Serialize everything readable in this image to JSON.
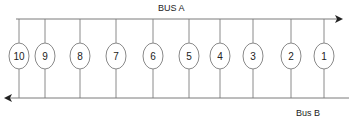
{
  "diagram": {
    "bus_a": {
      "label": "BUS A",
      "direction": "right",
      "y": 19,
      "x_start": 16,
      "x_end": 343
    },
    "bus_b": {
      "label": "Bus B",
      "direction": "left",
      "y": 98,
      "x_start": 4,
      "x_end": 349
    },
    "nodes": [
      {
        "id": "10",
        "label": "10",
        "x": 19
      },
      {
        "id": "9",
        "label": "9",
        "x": 45
      },
      {
        "id": "8",
        "label": "8",
        "x": 80
      },
      {
        "id": "7",
        "label": "7",
        "x": 116
      },
      {
        "id": "6",
        "label": "6",
        "x": 153
      },
      {
        "id": "5",
        "label": "5",
        "x": 189
      },
      {
        "id": "4",
        "label": "4",
        "x": 220
      },
      {
        "id": "3",
        "label": "3",
        "x": 253
      },
      {
        "id": "2",
        "label": "2",
        "x": 291
      },
      {
        "id": "1",
        "label": "1",
        "x": 324
      }
    ]
  }
}
